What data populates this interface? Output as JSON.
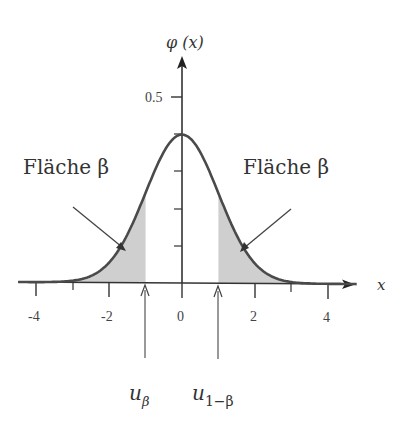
{
  "chart_data": {
    "type": "area",
    "title": "",
    "function": "standard normal density φ(x)",
    "xlabel": "x",
    "ylabel": "φ(x)",
    "xlim": [
      -4.5,
      4.8
    ],
    "ylim": [
      0,
      0.55
    ],
    "x_ticks": [
      -4,
      -3,
      -2,
      -1,
      0,
      1,
      2,
      3,
      4
    ],
    "x_tick_labels": [
      "-4",
      "",
      "-2",
      "",
      "0",
      "",
      "2",
      "",
      "4"
    ],
    "y_ticks": [
      0.1,
      0.2,
      0.3,
      0.4,
      0.5
    ],
    "y_tick_labels": [
      "",
      "",
      "",
      "",
      "0.5"
    ],
    "grid": false,
    "peak": {
      "x": 0,
      "y": 0.399
    },
    "shaded_regions": [
      {
        "from": -4.5,
        "to": -1,
        "label": "Fläche β"
      },
      {
        "from": 1,
        "to": 4.8,
        "label": "Fläche β"
      }
    ],
    "annotations": [
      {
        "text": "Fläche β",
        "position": "upper-left",
        "points_to_x": -1.5
      },
      {
        "text": "Fläche β",
        "position": "upper-right",
        "points_to_x": 1.5
      },
      {
        "text": "u_β",
        "marks_x": -1
      },
      {
        "text": "u_{1−β}",
        "marks_x": 1
      }
    ]
  },
  "labels": {
    "y_axis": "φ (x)",
    "x_axis": "x",
    "y_tick_05": "0.5",
    "x_m4": "-4",
    "x_m2": "-2",
    "x_0": "0",
    "x_2": "2",
    "x_4": "4",
    "area_left": "Fläche β",
    "area_right": "Fläche β",
    "u_beta_main": "u",
    "u_beta_sub": "β",
    "u_1mbeta_main": "u",
    "u_1mbeta_sub": "1−β"
  },
  "colors": {
    "curve": "#4a4a4a",
    "shade": "#cfcfcf",
    "axis": "#333333"
  }
}
